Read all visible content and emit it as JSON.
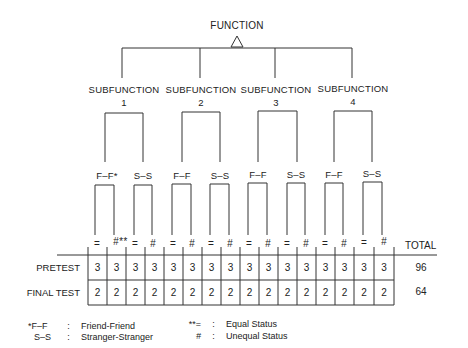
{
  "root": {
    "label": "FUNCTION"
  },
  "subfunctions": [
    {
      "label": "SUBFUNCTION",
      "number": "1"
    },
    {
      "label": "SUBFUNCTION",
      "number": "2"
    },
    {
      "label": "SUBFUNCTION",
      "number": "3"
    },
    {
      "label": "SUBFUNCTION",
      "number": "4"
    }
  ],
  "groups": [
    {
      "label": "F–F*"
    },
    {
      "label": "S–S"
    },
    {
      "label": "F–F"
    },
    {
      "label": "S–S"
    },
    {
      "label": "F–F"
    },
    {
      "label": "S–S"
    },
    {
      "label": "F–F"
    },
    {
      "label": "S–S"
    }
  ],
  "status_marks": [
    "=",
    "#**",
    "=",
    "#",
    "=",
    "#",
    "=",
    "#",
    "=",
    "#",
    "=",
    "#",
    "=",
    "#",
    "=",
    "#"
  ],
  "table": {
    "total_header": "TOTAL",
    "rows": [
      {
        "label": "PRETEST",
        "values": [
          "3",
          "3",
          "3",
          "3",
          "3",
          "3",
          "3",
          "3",
          "3",
          "3",
          "3",
          "3",
          "3",
          "3",
          "3",
          "3"
        ],
        "total": "96"
      },
      {
        "label": "FINAL TEST",
        "values": [
          "2",
          "2",
          "2",
          "2",
          "2",
          "2",
          "2",
          "2",
          "2",
          "2",
          "2",
          "2",
          "2",
          "2",
          "2",
          "2"
        ],
        "total": "64"
      }
    ]
  },
  "legend": [
    {
      "key": "*F–F",
      "sep": ":",
      "desc": "Friend-Friend"
    },
    {
      "key": "S–S",
      "sep": ":",
      "desc": "Stranger-Stranger"
    },
    {
      "key": "**=",
      "sep": ":",
      "desc": "Equal Status"
    },
    {
      "key": "#",
      "sep": ":",
      "desc": "Unequal Status"
    }
  ]
}
